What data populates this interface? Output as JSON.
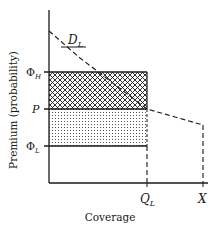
{
  "diagram": {
    "y_axis_label": "Premium (probability)",
    "x_axis_label": "Coverage",
    "y_ticks": [
      {
        "id": "phi_h",
        "base": "Φ",
        "sub": "H",
        "y": 72
      },
      {
        "id": "p",
        "base": "P",
        "sub": "",
        "y": 109
      },
      {
        "id": "phi_l",
        "base": "Φ",
        "sub": "L",
        "y": 146
      }
    ],
    "x_ticks": [
      {
        "id": "q_l",
        "base": "Q",
        "sub": "L",
        "x": 147
      },
      {
        "id": "x",
        "base": "X",
        "sub": "",
        "x": 203
      }
    ],
    "curve_label": {
      "base": "D",
      "sub": "L"
    },
    "regions": [
      {
        "name": "crosshatched",
        "from": "Φ_H",
        "to": "P",
        "pattern": "crosshatch"
      },
      {
        "name": "dotted",
        "from": "P",
        "to": "Φ_L",
        "pattern": "dots"
      }
    ],
    "colors": {
      "ink": "#1a1a1a",
      "background": "#ffffff"
    }
  }
}
